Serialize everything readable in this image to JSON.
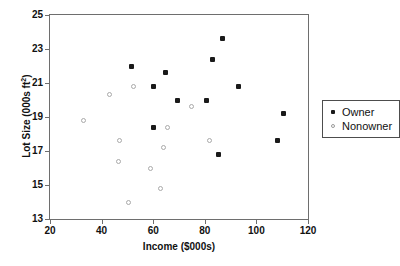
{
  "chart_data": {
    "type": "scatter",
    "title": "",
    "xlabel": "Income ($000s)",
    "ylabel": "Lot Size (000s ft²)",
    "xlim": [
      20,
      120
    ],
    "ylim": [
      13,
      25
    ],
    "xticks": [
      20,
      40,
      60,
      80,
      100,
      120
    ],
    "yticks": [
      13,
      15,
      17,
      19,
      21,
      23,
      25
    ],
    "grid": false,
    "legend_position": "right",
    "series": [
      {
        "name": "Owner",
        "marker": "filled-square",
        "color": "#1a1a1a",
        "points": [
          {
            "x": 51.5,
            "y": 22.0
          },
          {
            "x": 60.0,
            "y": 20.8
          },
          {
            "x": 64.8,
            "y": 21.6
          },
          {
            "x": 69.5,
            "y": 20.0
          },
          {
            "x": 80.8,
            "y": 20.0
          },
          {
            "x": 83.0,
            "y": 22.4
          },
          {
            "x": 87.0,
            "y": 23.6
          },
          {
            "x": 93.0,
            "y": 20.8
          },
          {
            "x": 60.0,
            "y": 18.4
          },
          {
            "x": 85.5,
            "y": 16.8
          },
          {
            "x": 108.0,
            "y": 17.6
          },
          {
            "x": 110.5,
            "y": 19.2
          }
        ]
      },
      {
        "name": "Nonowner",
        "marker": "open-circle",
        "color": "#a9a9a9",
        "points": [
          {
            "x": 33.0,
            "y": 18.8
          },
          {
            "x": 43.0,
            "y": 20.3
          },
          {
            "x": 52.5,
            "y": 20.8
          },
          {
            "x": 47.0,
            "y": 17.6
          },
          {
            "x": 46.5,
            "y": 16.4
          },
          {
            "x": 59.0,
            "y": 16.0
          },
          {
            "x": 63.0,
            "y": 14.8
          },
          {
            "x": 50.5,
            "y": 14.0
          },
          {
            "x": 65.5,
            "y": 18.4
          },
          {
            "x": 64.0,
            "y": 17.2
          },
          {
            "x": 75.0,
            "y": 19.6
          },
          {
            "x": 82.0,
            "y": 17.6
          }
        ]
      }
    ]
  },
  "legend": {
    "items": [
      {
        "label": "Owner",
        "marker": "filled-square"
      },
      {
        "label": "Nonowner",
        "marker": "open-circle"
      }
    ]
  }
}
